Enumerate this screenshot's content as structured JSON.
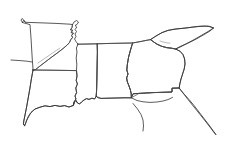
{
  "document": {
    "type": "outline-map",
    "title": "Southeastern United States outline map",
    "width": 228,
    "height": 147,
    "background_color": "#ffffff",
    "stroke_color": "#3a3a3a",
    "faint_stroke_color": "#8a8a8a",
    "style": "hand-traced thin line drawing, no labels, no fill"
  },
  "labels": {
    "visible_text": "",
    "note": "No text, legend, scale bar, or axis labels are rendered in this image."
  },
  "regions": [
    {
      "id": "arkansas",
      "name": "Arkansas",
      "role": "state-outline",
      "position": "upper-left",
      "path": "M22.5,22.5 L23.5,20.5 L25.5,22.3 L40,22.8 L56,23.4 L70,24.2 L72.5,24.6 L72.0,27.5 L70.5,29.8 L72.6,30.2 L71.2,32.6 L73.4,33.2 L71.6,35.4 L72.6,37.4 L70.8,39.6 L69.4,42.6 L67.2,45.0 L63.0,48.6 L57.0,53.2 L51.0,57.6 L45.0,62.2 L39.5,66.4 L35.5,69.6 L33.0,70.0 L32.8,66.0 L32.2,58.0 L31.6,48.0 L31.0,38.0 L30.4,30.0 L30.0,24.6 L22.5,22.5 Z"
    },
    {
      "id": "louisiana",
      "name": "Louisiana",
      "role": "state-outline",
      "position": "lower-left",
      "path": "M33.0,70.0 L50.0,70.2 L64.0,70.4 L76.5,70.6 L77.0,76.0 L76.2,80.5 L77.4,84.0 L75.8,88.0 L76.6,92.5 L75.0,96.0 L76.0,99.0 L74.0,102.0 L73.2,105.5 L69.0,107.0 L64.5,105.6 L60.0,106.4 L55.0,105.4 L50.0,106.6 L45.0,105.8 L40.0,107.2 L35.0,109.0 L31.0,112.5 L28.5,116.0 L26.8,120.0 L25.6,123.5 L24.6,125.8 L23.4,124.0 L23.8,121.0 L25.0,115.0 L26.6,107.0 L28.2,98.0 L29.8,89.0 L31.2,80.0 L32.4,73.5 L33.0,70.0 Z"
    },
    {
      "id": "mississippi",
      "name": "Mississippi",
      "role": "state-outline",
      "position": "center-left",
      "path": "M78.0,44.2 L88.0,44.0 L97.2,43.8 L97.4,52.0 L97.2,62.0 L97.0,72.0 L96.8,82.0 L96.6,90.0 L96.2,96.4 L94.5,99.0 L92.0,98.2 L89.0,99.4 L86.5,98.6 L84.0,100.0 L81.5,102.0 L79.5,104.0 L77.5,103.0 L76.0,100.5 L74.5,102.0 L73.4,105.5 L74.0,102.0 L76.0,99.0 L75.0,96.0 L76.6,92.5 L75.8,88.0 L77.4,84.0 L76.2,80.5 L77.0,76.0 L76.5,70.6 L76.8,64.0 L76.2,58.0 L77.0,52.0 L76.4,48.0 L78.0,44.2 Z"
    },
    {
      "id": "alabama",
      "name": "Alabama",
      "role": "state-outline",
      "position": "center",
      "path": "M97.2,43.8 L110.0,43.4 L122.0,43.2 L132.6,43.0 L130.5,50.0 L128.6,57.0 L127.4,64.0 L126.8,70.0 L128.0,74.0 L126.6,78.0 L127.4,82.0 L129.0,86.0 L130.4,90.0 L131.2,93.6 L131.4,97.8 L124.0,97.8 L116.0,98.0 L108.0,98.2 L101.0,98.4 L97.8,97.8 L96.2,96.4 L96.6,90.0 L96.8,82.0 L97.0,72.0 L97.2,62.0 L97.4,52.0 L97.2,43.8 Z"
    },
    {
      "id": "georgia",
      "name": "Georgia",
      "role": "state-outline",
      "position": "center-right",
      "path": "M132.6,43.0 L140.0,41.6 L146.0,40.4 L150.5,39.6 L153.5,41.8 L157.0,44.2 L161.5,46.2 L166.5,47.6 L171.5,48.2 L175.5,49.0 L180.0,51.2 L183.0,54.6 L184.6,59.0 L185.0,64.0 L184.2,69.0 L182.6,74.0 L181.0,79.0 L179.8,84.0 L179.2,88.0 L172.0,88.2 L172.0,92.0 L166.0,92.2 L160.0,92.4 L153.0,92.6 L146.0,93.0 L139.0,93.4 L133.0,93.8 L131.4,97.8 L131.2,93.6 L130.4,90.0 L129.0,86.0 L127.4,82.0 L126.6,78.0 L128.0,74.0 L126.8,70.0 L127.4,64.0 L128.6,57.0 L130.5,50.0 L132.6,43.0 Z"
    },
    {
      "id": "south-carolina",
      "name": "South Carolina",
      "role": "state-outline",
      "position": "upper-right",
      "path": "M150.5,39.6 L156.0,36.0 L162.0,32.6 L168.0,30.4 L174.0,29.2 L180.0,28.6 L186.0,28.0 L192.0,27.2 L198.0,26.4 L204.0,26.0 L210.0,26.4 L213.5,28.0 L210.0,31.0 L204.0,34.6 L198.0,38.0 L192.0,41.2 L186.0,44.0 L180.0,46.6 L175.5,49.0 L171.5,48.2 L166.5,47.6 L161.5,46.2 L157.0,44.2 L153.5,41.8 L150.5,39.6 Z"
    },
    {
      "id": "florida-panhandle",
      "name": "Florida panhandle",
      "role": "state-outline-partial",
      "position": "bottom-right",
      "path": "M131.4,97.8 L133.0,93.8 L139.0,93.4 L146.0,93.0 L153.0,92.6 L160.0,92.4 L166.0,92.2 L172.0,92.0 L172.0,88.2 L179.2,88.0 L181.0,90.5 L184.5,94.5 L189.0,99.5 L194.0,105.5 L199.0,112.0 L204.0,118.5 L209.0,125.0 L213.0,130.5 L216.0,134.5"
    }
  ],
  "internal_borders": [
    {
      "id": "ar-la-border",
      "name": "Arkansas / Louisiana border",
      "path": "M33.0,70.0 L50.0,70.2 L64.0,70.4 L76.5,70.6"
    },
    {
      "id": "ms-al-border",
      "name": "Mississippi / Alabama border",
      "path": "M97.2,43.8 L97.4,52.0 L97.2,62.0 L97.0,72.0 L96.8,82.0 L96.6,90.0 L96.2,96.4"
    },
    {
      "id": "al-ga-border",
      "name": "Alabama / Georgia border (Chattahoochee)",
      "path": "M132.6,43.0 L130.5,50.0 L128.6,57.0 L127.4,64.0 L126.8,70.0 L128.0,74.0 L126.6,78.0 L127.4,82.0 L129.0,86.0 L130.4,90.0 L131.2,93.6 L131.4,97.8"
    },
    {
      "id": "tn-ms-al-north-border",
      "name": "Tennessee southern border",
      "path": "M78.0,44.2 L90.0,44.0 L104.0,43.6 L118.0,43.3 L132.6,43.0 L141.0,41.5 L150.5,39.6"
    },
    {
      "id": "ga-sc-border",
      "name": "Georgia / South Carolina border (Savannah River)",
      "path": "M150.5,39.6 L153.5,41.8 L157.0,44.2 L161.5,46.2 L166.5,47.6 L171.5,48.2 L175.5,49.0"
    },
    {
      "id": "ms-river-ar-east",
      "name": "Mississippi River, Arkansas east border",
      "path": "M72.5,24.6 L72.0,27.5 L70.5,29.8 L72.6,30.2 L71.2,32.6 L73.4,33.2 L71.6,35.4 L72.6,37.4 L70.8,39.6 L69.4,42.6 L67.2,45.0 L63.0,48.6 L57.0,53.2 L51.0,57.6 L45.0,62.2 L39.5,66.4 L35.5,69.6 L33.0,70.0"
    },
    {
      "id": "ga-fl-border",
      "name": "Georgia / Florida border",
      "path": "M131.4,97.8 L139.0,93.4 L153.0,92.6 L166.0,92.2 L172.0,92.0 L172.0,88.2 L179.2,88.0"
    }
  ],
  "coastline": [
    {
      "id": "gulf-coast-louisiana",
      "name": "Gulf coast of Louisiana with delta",
      "path": "M24.6,125.8 L26.8,120.0 L31.0,112.5 L35.0,109.0 L40.0,107.2 L45.0,105.8 L50.0,106.6 L55.0,105.4 L60.0,106.4 L64.5,105.6 L69.0,107.0 L73.2,105.5 L74.5,102.0 L76.0,100.5 L77.5,103.0 L79.5,104.0 L81.5,102.0 L84.0,100.0 L86.5,98.6 L89.0,99.4 L92.0,98.2 L94.5,99.0 L96.2,96.4"
    },
    {
      "id": "gulf-coast-alabama-florida",
      "name": "Gulf coast of Alabama and Florida panhandle",
      "path": "M96.2,96.4 L101.0,98.4 L108.0,98.2 L116.0,98.0 L124.0,97.8 L131.4,97.8 L137.0,100.5 L143.0,101.8 L150.0,102.4 L157.0,102.0 L163.0,101.0 L168.0,99.6 L172.5,97.4"
    },
    {
      "id": "florida-west-coast",
      "name": "Florida west coast heading to peninsula",
      "path": "M133.0,103.5 L137.5,109.0 L141.0,114.5 L143.0,120.0 L143.5,126.0 L143.0,131.0"
    },
    {
      "id": "florida-east-coast",
      "name": "Florida east coast heading to peninsula",
      "path": "M179.2,88.0 L183.0,93.0 L188.0,99.5 L194.0,107.0 L200.0,114.5 L206.0,122.0 L211.0,128.5 L215.5,134.5"
    },
    {
      "id": "atlantic-coast-sc",
      "name": "Atlantic coast of South Carolina",
      "path": "M213.5,28.0 L208.0,31.5 L202.0,35.0 L196.0,38.5 L190.0,41.8 L184.0,45.0 L179.0,47.6 L175.5,49.0 L180.0,51.2 L183.0,54.6 L184.6,59.0 L185.0,64.0 L184.2,69.0 L182.6,74.0 L181.0,79.0 L179.8,84.0 L179.2,88.0"
    },
    {
      "id": "sc-nc-north-border",
      "name": "South Carolina northern border",
      "path": "M150.5,39.6 L156.0,36.0 L162.0,32.6 L168.0,30.4 L176.0,29.0 L184.0,28.2 L192.0,27.2 L200.0,26.4 L208.0,26.2 L213.5,28.0"
    },
    {
      "id": "missouri-bootheel",
      "name": "Missouri bootheel notch north of Arkansas",
      "path": "M72.5,24.6 L74.0,22.0 L76.5,20.5 L78.5,22.0 L77.0,24.5 L75.0,25.5 L76.8,27.0 L75.0,29.5 L76.5,31.5 L75.0,34.0 L76.0,36.5 L74.5,39.0 L76.0,41.5 L78.0,44.2"
    },
    {
      "id": "arkansas-nw-corner",
      "name": "Arkansas northwest corner tick",
      "path": "M22.5,22.5 L21.0,20.0 L22.0,18.5 L23.8,20.0 L25.5,22.3"
    },
    {
      "id": "louisiana-west-edge",
      "name": "Louisiana / Texas west border",
      "path": "M33.0,70.0 L31.2,80.0 L29.8,89.0 L28.2,98.0 L26.6,107.0 L25.0,115.0 L23.8,121.0 L23.4,124.0 L24.6,125.8"
    },
    {
      "id": "texas-tick-west",
      "name": "Short western map edge stub",
      "path": "M11.0,60.0 L20.0,60.6 L27.0,61.2 L32.0,62.0"
    }
  ],
  "faint_marks": [
    {
      "id": "sc-inner-mark",
      "name": "faint interior pencil mark in South Carolina",
      "path": "M160.0,41.0 L165.0,42.5 L170.0,43.2"
    },
    {
      "id": "ar-inner-mark",
      "name": "faint interior pencil mark in Arkansas",
      "path": "M38.0,63.0 L46.0,57.5 L54.0,52.0 L60.0,48.0"
    }
  ]
}
